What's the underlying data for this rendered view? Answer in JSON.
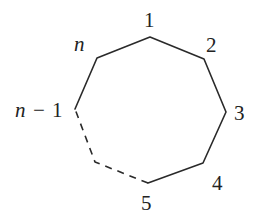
{
  "diagram": {
    "type": "polygon",
    "colors": {
      "stroke": "#2a2a2a",
      "text": "#222222",
      "background": "#ffffff"
    },
    "vertices": [
      {
        "id": "v1",
        "label": "1",
        "x": 150,
        "y": 37
      },
      {
        "id": "v2",
        "label": "2",
        "x": 204,
        "y": 59
      },
      {
        "id": "v3",
        "label": "3",
        "x": 226,
        "y": 112
      },
      {
        "id": "v4",
        "label": "4",
        "x": 203,
        "y": 163
      },
      {
        "id": "v5",
        "label": "5",
        "x": 148,
        "y": 183
      },
      {
        "id": "vn1",
        "label": "n − 1",
        "x": 75,
        "y": 109
      },
      {
        "id": "vn",
        "label": "n",
        "x": 97,
        "y": 58
      }
    ],
    "edges": [
      {
        "from": "1",
        "to": "2",
        "style": "solid"
      },
      {
        "from": "2",
        "to": "3",
        "style": "solid"
      },
      {
        "from": "3",
        "to": "4",
        "style": "solid"
      },
      {
        "from": "4",
        "to": "5",
        "style": "solid"
      },
      {
        "from": "5",
        "to": "n − 1",
        "style": "dashed"
      },
      {
        "from": "n − 1",
        "to": "n",
        "style": "solid"
      },
      {
        "from": "n",
        "to": "1",
        "style": "solid"
      }
    ],
    "labels": {
      "v1": "1",
      "v2": "2",
      "v3": "3",
      "v4": "4",
      "v5": "5",
      "vn1_n": "n",
      "vn1_minus": "−",
      "vn1_one": "1",
      "vn": "n"
    }
  }
}
